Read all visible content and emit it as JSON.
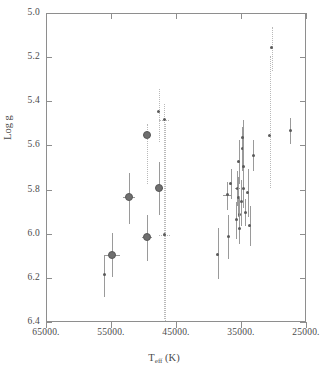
{
  "figure": {
    "background": "#ffffff",
    "frame_color": "#8e8e8e",
    "marker_color": "#5a5a5a",
    "errorbar_color": "#9a9a9a",
    "dotted_errorbar_color": "#b9b9b9"
  },
  "axis": {
    "y_title": "Log g",
    "x_title_main": "T",
    "x_title_sub": "eff",
    "x_title_unit": "(K)",
    "y_ticks": [
      "5.0",
      "5.2",
      "5.4",
      "5.6",
      "5.8",
      "6.0",
      "6.2",
      "6.4"
    ],
    "x_ticks": [
      "65000.",
      "55000.",
      "45000.",
      "35000.",
      "25000."
    ]
  },
  "chart_data": {
    "type": "scatter",
    "title": "",
    "xlabel": "T_eff (K)",
    "ylabel": "Log g",
    "xlim": [
      65000,
      25000
    ],
    "ylim": [
      6.4,
      5.0
    ],
    "x_inverted": true,
    "y_inverted": true,
    "grid": false,
    "legend": null,
    "xtick_values": [
      65000,
      55000,
      45000,
      35000,
      25000
    ],
    "ytick_values": [
      5.0,
      5.2,
      5.4,
      5.6,
      5.8,
      6.0,
      6.2,
      6.4
    ],
    "points": [
      {
        "x": 56200,
        "y": 6.18,
        "yerr_lo": 0.1,
        "yerr_hi": 0.09,
        "xerr": 0,
        "size": "small",
        "dotted": false
      },
      {
        "x": 55000,
        "y": 6.09,
        "yerr_lo": 0.1,
        "yerr_hi": 0.1,
        "xerr": 1300,
        "size": "big",
        "dotted": false
      },
      {
        "x": 52400,
        "y": 5.83,
        "yerr_lo": 0.12,
        "yerr_hi": 0.11,
        "xerr": 900,
        "size": "big",
        "dotted": false
      },
      {
        "x": 49600,
        "y": 5.55,
        "yerr_lo": 0.22,
        "yerr_hi": 0.05,
        "xerr": 600,
        "size": "big",
        "dotted": true
      },
      {
        "x": 49600,
        "y": 6.01,
        "yerr_lo": 0.11,
        "yerr_hi": 0.1,
        "xerr": 800,
        "size": "big",
        "dotted": false
      },
      {
        "x": 47800,
        "y": 5.44,
        "yerr_lo": 0.14,
        "yerr_hi": 0.1,
        "xerr": 0,
        "size": "small",
        "dotted": true
      },
      {
        "x": 47700,
        "y": 5.79,
        "yerr_lo": 0.12,
        "yerr_hi": 0.12,
        "xerr": 600,
        "size": "big",
        "dotted": false
      },
      {
        "x": 47000,
        "y": 5.48,
        "yerr_lo": 0.9,
        "yerr_hi": 0.07,
        "xerr": 700,
        "size": "small",
        "dotted": true
      },
      {
        "x": 46900,
        "y": 6.0,
        "yerr_lo": 0.4,
        "yerr_hi": 0.5,
        "xerr": 900,
        "size": "small",
        "dotted": true
      },
      {
        "x": 38700,
        "y": 6.09,
        "yerr_lo": 0.11,
        "yerr_hi": 0.12,
        "xerr": 0,
        "size": "small",
        "dotted": false
      },
      {
        "x": 37300,
        "y": 5.82,
        "yerr_lo": 0.07,
        "yerr_hi": 0.06,
        "xerr": 600,
        "size": "small",
        "dotted": false
      },
      {
        "x": 37100,
        "y": 6.01,
        "yerr_lo": 0.1,
        "yerr_hi": 0.1,
        "xerr": 0,
        "size": "small",
        "dotted": false
      },
      {
        "x": 36700,
        "y": 5.77,
        "yerr_lo": 0.07,
        "yerr_hi": 0.07,
        "xerr": 0,
        "size": "small",
        "dotted": false
      },
      {
        "x": 35900,
        "y": 5.93,
        "yerr_lo": 0.09,
        "yerr_hi": 0.08,
        "xerr": 0,
        "size": "small",
        "dotted": false
      },
      {
        "x": 35700,
        "y": 5.79,
        "yerr_lo": 0.08,
        "yerr_hi": 0.08,
        "xerr": 400,
        "size": "small",
        "dotted": false
      },
      {
        "x": 35600,
        "y": 5.83,
        "yerr_lo": 0.09,
        "yerr_hi": 0.09,
        "xerr": 0,
        "size": "small",
        "dotted": false
      },
      {
        "x": 35500,
        "y": 5.67,
        "yerr_lo": 0.1,
        "yerr_hi": 0.1,
        "xerr": 0,
        "size": "small",
        "dotted": false
      },
      {
        "x": 35400,
        "y": 5.91,
        "yerr_lo": 0.08,
        "yerr_hi": 0.08,
        "xerr": 0,
        "size": "small",
        "dotted": false
      },
      {
        "x": 35400,
        "y": 5.97,
        "yerr_lo": 0.07,
        "yerr_hi": 0.07,
        "xerr": 0,
        "size": "small",
        "dotted": false
      },
      {
        "x": 35100,
        "y": 5.85,
        "yerr_lo": 0.11,
        "yerr_hi": 0.1,
        "xerr": 0,
        "size": "small",
        "dotted": false
      },
      {
        "x": 35000,
        "y": 5.61,
        "yerr_lo": 0.1,
        "yerr_hi": 0.1,
        "xerr": 0,
        "size": "small",
        "dotted": false
      },
      {
        "x": 34900,
        "y": 5.56,
        "yerr_lo": 0.08,
        "yerr_hi": 0.08,
        "xerr": 0,
        "size": "small",
        "dotted": false
      },
      {
        "x": 34800,
        "y": 5.79,
        "yerr_lo": 0.09,
        "yerr_hi": 0.09,
        "xerr": 0,
        "size": "small",
        "dotted": false
      },
      {
        "x": 34800,
        "y": 5.69,
        "yerr_lo": 0.07,
        "yerr_hi": 0.07,
        "xerr": 0,
        "size": "small",
        "dotted": false
      },
      {
        "x": 34500,
        "y": 5.9,
        "yerr_lo": 0.06,
        "yerr_hi": 0.06,
        "xerr": 0,
        "size": "small",
        "dotted": false
      },
      {
        "x": 34100,
        "y": 5.81,
        "yerr_lo": 0.11,
        "yerr_hi": 0.11,
        "xerr": 0,
        "size": "small",
        "dotted": false
      },
      {
        "x": 33800,
        "y": 5.96,
        "yerr_lo": 0.09,
        "yerr_hi": 0.09,
        "xerr": 0,
        "size": "small",
        "dotted": false
      },
      {
        "x": 33300,
        "y": 5.64,
        "yerr_lo": 0.07,
        "yerr_hi": 0.07,
        "xerr": 0,
        "size": "small",
        "dotted": false
      },
      {
        "x": 30700,
        "y": 5.55,
        "yerr_lo": 0.24,
        "yerr_hi": 0.36,
        "xerr": 0,
        "size": "small",
        "dotted": true
      },
      {
        "x": 30400,
        "y": 5.15,
        "yerr_lo": 0.11,
        "yerr_hi": 0.09,
        "xerr": 0,
        "size": "small",
        "dotted": true
      },
      {
        "x": 27600,
        "y": 5.53,
        "yerr_lo": 0.06,
        "yerr_hi": 0.06,
        "xerr": 0,
        "size": "small",
        "dotted": false
      }
    ]
  }
}
